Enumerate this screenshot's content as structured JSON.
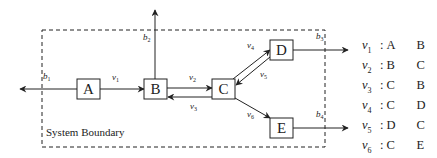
{
  "diagram": {
    "boundary_label": "System Boundary",
    "nodes": [
      {
        "id": "A",
        "label": "A"
      },
      {
        "id": "B",
        "label": "B"
      },
      {
        "id": "C",
        "label": "C"
      },
      {
        "id": "D",
        "label": "D"
      },
      {
        "id": "E",
        "label": "E"
      }
    ],
    "internal_edges": [
      {
        "var": "v",
        "sub": "1",
        "from": "A",
        "to": "B"
      },
      {
        "var": "v",
        "sub": "2",
        "from": "B",
        "to": "C"
      },
      {
        "var": "v",
        "sub": "3",
        "from": "C",
        "to": "B"
      },
      {
        "var": "v",
        "sub": "4",
        "from": "C",
        "to": "D"
      },
      {
        "var": "v",
        "sub": "5",
        "from": "D",
        "to": "C"
      },
      {
        "var": "v",
        "sub": "6",
        "from": "C",
        "to": "E"
      }
    ],
    "boundary_flows": [
      {
        "var": "b",
        "sub": "1",
        "from": "A",
        "direction": "left"
      },
      {
        "var": "b",
        "sub": "2",
        "from": "B",
        "direction": "up"
      },
      {
        "var": "b",
        "sub": "3",
        "from": "D",
        "direction": "right"
      },
      {
        "var": "b",
        "sub": "4",
        "from": "E",
        "direction": "right"
      }
    ]
  },
  "legend": [
    {
      "var": "v",
      "sub": "1",
      "from": "A",
      "to": "B"
    },
    {
      "var": "v",
      "sub": "2",
      "from": "B",
      "to": "C"
    },
    {
      "var": "v",
      "sub": "3",
      "from": "C",
      "to": "B"
    },
    {
      "var": "v",
      "sub": "4",
      "from": "C",
      "to": "D"
    },
    {
      "var": "v",
      "sub": "5",
      "from": "D",
      "to": "C"
    },
    {
      "var": "v",
      "sub": "6",
      "from": "C",
      "to": "E"
    }
  ]
}
